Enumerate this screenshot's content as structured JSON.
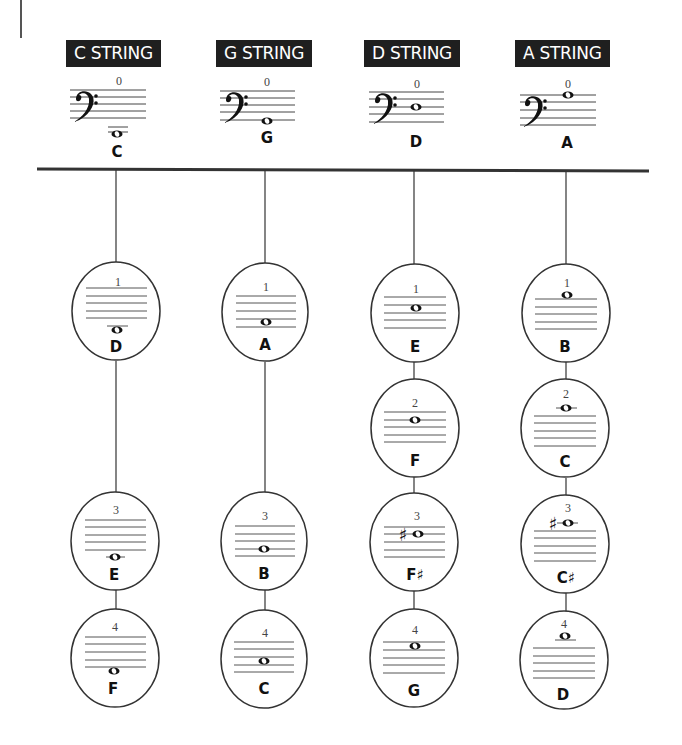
{
  "strings": [
    {
      "name": "C STRING",
      "open": {
        "finger": "0",
        "note": "C"
      },
      "fingers": [
        {
          "finger": "1",
          "note": "D"
        },
        {
          "finger": "3",
          "note": "E"
        },
        {
          "finger": "4",
          "note": "F"
        }
      ]
    },
    {
      "name": "G STRING",
      "open": {
        "finger": "0",
        "note": "G"
      },
      "fingers": [
        {
          "finger": "1",
          "note": "A"
        },
        {
          "finger": "3",
          "note": "B"
        },
        {
          "finger": "4",
          "note": "C"
        }
      ]
    },
    {
      "name": "D STRING",
      "open": {
        "finger": "0",
        "note": "D"
      },
      "fingers": [
        {
          "finger": "1",
          "note": "E"
        },
        {
          "finger": "2",
          "note": "F"
        },
        {
          "finger": "3",
          "note": "F♯"
        },
        {
          "finger": "4",
          "note": "G"
        }
      ]
    },
    {
      "name": "A STRING",
      "open": {
        "finger": "0",
        "note": "A"
      },
      "fingers": [
        {
          "finger": "1",
          "note": "B"
        },
        {
          "finger": "2",
          "note": "C"
        },
        {
          "finger": "3",
          "note": "C♯"
        },
        {
          "finger": "4",
          "note": "D"
        }
      ]
    }
  ],
  "colors": {
    "ink": "#1f1f1f",
    "paper": "#ffffff",
    "staff": "#555555"
  }
}
